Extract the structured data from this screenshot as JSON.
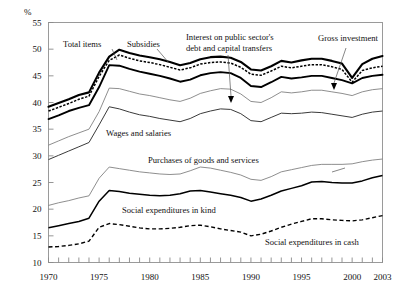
{
  "chart_data": {
    "type": "line",
    "title": "",
    "subtitle": "",
    "xlabel": "",
    "ylabel": "%",
    "unit_label": "%",
    "xlim": [
      1970,
      2003
    ],
    "ylim": [
      10,
      55
    ],
    "ytick_step": 5,
    "grid": false,
    "legend": "annotated-inline",
    "x": [
      1970,
      1971,
      1972,
      1973,
      1974,
      1975,
      1976,
      1977,
      1978,
      1979,
      1980,
      1981,
      1982,
      1983,
      1984,
      1985,
      1986,
      1987,
      1988,
      1989,
      1990,
      1991,
      1992,
      1993,
      1994,
      1995,
      1996,
      1997,
      1998,
      1999,
      2000,
      2001,
      2002,
      2003
    ],
    "ytick_labels": [
      "10",
      "15",
      "20",
      "25",
      "30",
      "35",
      "40",
      "45",
      "50",
      "55"
    ],
    "xtick_labels": [
      "1970",
      "1975",
      "1980",
      "1985",
      "1990",
      "1995",
      "2000",
      "2003"
    ],
    "xtick_label_years": [
      1970,
      1975,
      1980,
      1985,
      1990,
      1995,
      2000,
      2003
    ],
    "series": [
      {
        "name": "Total items",
        "style": "thick-solid",
        "values": [
          39.2,
          39.9,
          40.6,
          41.4,
          41.9,
          45.6,
          48.6,
          49.9,
          49.3,
          48.8,
          48.5,
          48.1,
          47.6,
          47.0,
          47.4,
          48.1,
          48.5,
          48.6,
          48.4,
          47.6,
          46.2,
          46.0,
          46.8,
          47.8,
          47.5,
          47.9,
          48.2,
          48.2,
          47.8,
          47.3,
          44.6,
          47.2,
          48.2,
          48.7
        ]
      },
      {
        "name": "Subsidies",
        "style": "dotted",
        "values": [
          38.4,
          39.1,
          39.8,
          40.6,
          41.2,
          44.9,
          47.9,
          48.9,
          48.3,
          47.8,
          47.5,
          47.1,
          46.6,
          46.1,
          46.5,
          47.2,
          47.5,
          47.6,
          47.4,
          46.6,
          45.3,
          45.1,
          45.9,
          46.8,
          46.5,
          46.8,
          47.1,
          47.1,
          46.7,
          46.2,
          43.8,
          46.0,
          46.5,
          46.8
        ]
      },
      {
        "name": "Interest on public sector's debt and capital transfers",
        "style": "thick-solid",
        "values": [
          36.9,
          37.6,
          38.4,
          39.0,
          39.5,
          42.9,
          47.0,
          46.9,
          46.3,
          45.8,
          45.4,
          45.0,
          44.5,
          43.9,
          44.3,
          45.1,
          45.5,
          45.7,
          45.5,
          44.6,
          43.1,
          42.9,
          43.8,
          44.8,
          44.5,
          44.7,
          45.0,
          45.0,
          44.6,
          44.2,
          43.6,
          44.6,
          45.0,
          45.2
        ]
      },
      {
        "name": "Wages and salaries (upper bound)",
        "style": "thin-solid",
        "values": [
          32.0,
          32.8,
          33.6,
          34.3,
          35.0,
          38.3,
          42.7,
          42.6,
          42.1,
          41.6,
          41.3,
          40.9,
          40.5,
          40.2,
          40.8,
          41.7,
          42.2,
          42.6,
          42.5,
          41.6,
          40.2,
          40.0,
          40.9,
          42.0,
          41.8,
          42.0,
          42.3,
          42.3,
          42.0,
          41.7,
          41.3,
          42.0,
          42.4,
          42.6
        ]
      },
      {
        "name": "Wages and salaries",
        "style": "medium-solid",
        "values": [
          29.3,
          30.1,
          30.9,
          31.7,
          32.5,
          35.8,
          39.2,
          38.8,
          38.2,
          37.7,
          37.4,
          37.0,
          36.7,
          36.4,
          37.0,
          37.9,
          38.4,
          38.8,
          38.7,
          37.9,
          36.6,
          36.4,
          37.2,
          38.0,
          37.9,
          38.0,
          38.2,
          38.1,
          37.8,
          37.5,
          37.2,
          37.8,
          38.2,
          38.4
        ]
      },
      {
        "name": "Purchases of goods and services",
        "style": "thin-solid",
        "values": [
          20.7,
          21.2,
          21.6,
          22.1,
          22.5,
          25.8,
          27.9,
          27.6,
          27.3,
          27.0,
          26.8,
          26.6,
          26.5,
          26.6,
          27.2,
          27.9,
          27.7,
          27.3,
          26.9,
          26.4,
          25.6,
          25.4,
          26.1,
          27.0,
          27.4,
          27.8,
          28.2,
          28.4,
          28.4,
          28.4,
          28.5,
          28.9,
          29.2,
          29.4
        ]
      },
      {
        "name": "Social expenditures in kind",
        "style": "medium-solid",
        "values": [
          16.5,
          16.9,
          17.3,
          17.7,
          18.3,
          21.5,
          23.5,
          23.3,
          23.0,
          22.8,
          22.6,
          22.5,
          22.6,
          22.9,
          23.4,
          23.5,
          23.2,
          22.9,
          22.6,
          22.2,
          21.5,
          21.9,
          22.6,
          23.4,
          23.9,
          24.4,
          25.1,
          25.2,
          25.0,
          24.9,
          24.9,
          25.3,
          25.9,
          26.3
        ]
      },
      {
        "name": "Social expenditures in cash",
        "style": "dashed",
        "values": [
          12.9,
          13.0,
          13.2,
          13.5,
          14.0,
          16.6,
          17.3,
          17.1,
          16.8,
          16.5,
          16.3,
          16.3,
          16.4,
          16.6,
          16.9,
          17.0,
          16.7,
          16.3,
          16.0,
          15.7,
          15.0,
          15.3,
          15.9,
          16.6,
          17.2,
          17.7,
          18.2,
          18.2,
          18.0,
          17.9,
          17.8,
          18.0,
          18.4,
          18.8
        ]
      }
    ],
    "annotations": [
      {
        "id": "total-items",
        "text": "Total items"
      },
      {
        "id": "subsidies",
        "text": "Subsidies"
      },
      {
        "id": "interest-line1",
        "text": "Interest on public sector's"
      },
      {
        "id": "interest-line2",
        "text": "debt and capital transfers"
      },
      {
        "id": "gross-investment",
        "text": "Gross investment"
      },
      {
        "id": "wages-and-salaries",
        "text": "Wages and salaries"
      },
      {
        "id": "purchases",
        "text": "Purchases of goods and services"
      },
      {
        "id": "social-in-kind",
        "text": "Social expenditures in kind"
      },
      {
        "id": "social-in-cash",
        "text": "Social expenditures in cash"
      }
    ]
  }
}
